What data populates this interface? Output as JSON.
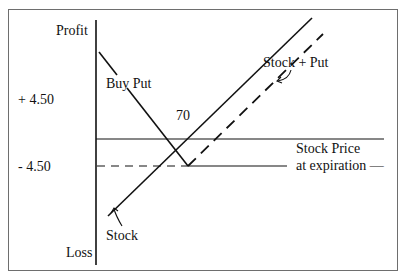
{
  "diagram": {
    "axes": {
      "y_top_label": "Profit",
      "y_bottom_label": "Loss",
      "x_label_line1": "Stock Price",
      "x_label_line2": "at expiration —"
    },
    "levels": {
      "plus": "+ 4.50",
      "minus": "- 4.50"
    },
    "strike_label": "70",
    "lines": {
      "buy_put": "Buy Put",
      "stock_plus_put": "Stock + Put",
      "stock": "Stock"
    },
    "colors": {
      "line": "#111111",
      "frame": "#6e6e6e",
      "background": "#ffffff"
    }
  }
}
